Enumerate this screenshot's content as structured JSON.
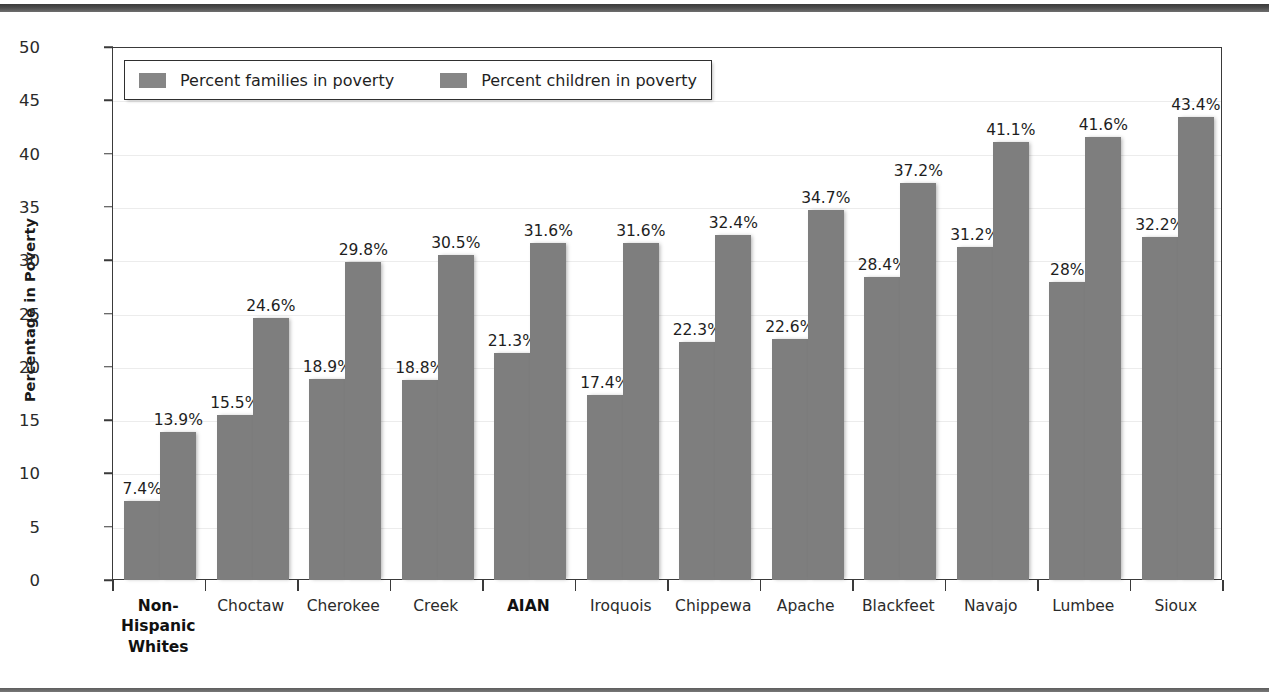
{
  "figure": {
    "y_axis_title": "Percentage in Poverty"
  },
  "legend": {
    "entries": [
      {
        "label": "Percent families in poverty",
        "color": "#868686",
        "swatch": "legend-swatch-families"
      },
      {
        "label": "Percent children in poverty",
        "color": "#868686",
        "swatch": "legend-swatch-children"
      }
    ]
  },
  "axes": {
    "y_ticks": [
      "0",
      "5",
      "10",
      "15",
      "20",
      "25",
      "30",
      "35",
      "40",
      "45",
      "50"
    ]
  },
  "chart_data": {
    "type": "bar",
    "title": "",
    "xlabel": "",
    "ylabel": "Percentage in Poverty",
    "ylim": [
      0,
      50
    ],
    "ytick_step": 5,
    "grid": true,
    "legend_position": "top-left (inside plot)",
    "bar_color": "#7e7e7e",
    "categories": [
      "Non-Hispanic Whites",
      "Choctaw",
      "Cherokee",
      "Creek",
      "AIAN",
      "Iroquois",
      "Chippewa",
      "Apache",
      "Blackfeet",
      "Navajo",
      "Lumbee",
      "Sioux"
    ],
    "category_lines": [
      [
        "Non-",
        "Hispanic",
        "Whites"
      ],
      [
        "Choctaw"
      ],
      [
        "Cherokee"
      ],
      [
        "Creek"
      ],
      [
        "AIAN"
      ],
      [
        "Iroquois"
      ],
      [
        "Chippewa"
      ],
      [
        "Apache"
      ],
      [
        "Blackfeet"
      ],
      [
        "Navajo"
      ],
      [
        "Lumbee"
      ],
      [
        "Sioux"
      ]
    ],
    "emphasized_categories": [
      "Non-Hispanic Whites",
      "AIAN"
    ],
    "series": [
      {
        "name": "Percent families in poverty",
        "values": [
          7.4,
          15.5,
          18.9,
          18.8,
          21.3,
          17.4,
          22.3,
          22.6,
          28.4,
          31.2,
          28.0,
          32.2
        ],
        "labels": [
          "7.4%",
          "15.5%",
          "18.9%",
          "18.8%",
          "21.3%",
          "17.4%",
          "22.3%",
          "22.6%",
          "28.4%",
          "31.2%",
          "28%",
          "32.2%"
        ]
      },
      {
        "name": "Percent children in poverty",
        "values": [
          13.9,
          24.6,
          29.8,
          30.5,
          31.6,
          31.6,
          32.4,
          34.7,
          37.2,
          41.1,
          41.6,
          43.4
        ],
        "labels": [
          "13.9%",
          "24.6%",
          "29.8%",
          "30.5%",
          "31.6%",
          "31.6%",
          "32.4%",
          "34.7%",
          "37.2%",
          "41.1%",
          "41.6%",
          "43.4%"
        ]
      }
    ]
  }
}
